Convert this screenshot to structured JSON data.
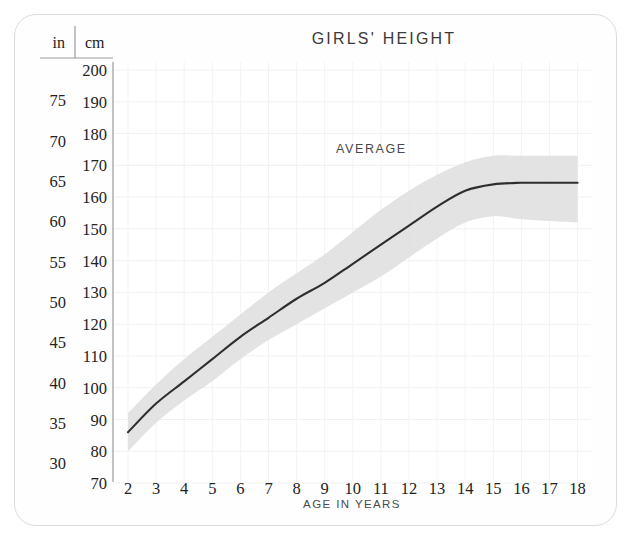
{
  "card": {
    "title": "GIRLS' HEIGHT"
  },
  "axes": {
    "left_header_in": "in",
    "left_header_cm": "cm",
    "x_axis_label": "AGE IN YEARS",
    "cm_ticks": [
      "200",
      "190",
      "180",
      "170",
      "160",
      "150",
      "140",
      "130",
      "120",
      "110",
      "100",
      "90",
      "80",
      "70"
    ],
    "in_ticks": [
      "75",
      "70",
      "65",
      "60",
      "55",
      "50",
      "45",
      "40",
      "35",
      "30"
    ],
    "age_ticks": [
      "2",
      "3",
      "4",
      "5",
      "6",
      "7",
      "8",
      "9",
      "10",
      "11",
      "12",
      "13",
      "14",
      "15",
      "16",
      "17",
      "18"
    ]
  },
  "annotations": {
    "average": "AVERAGE"
  },
  "colors": {
    "curve": "#2e2e2e",
    "band": "#dddddd",
    "grid": "#f0f0f0",
    "border": "#dcdcdc",
    "text": "#232323",
    "background": "#fefefe"
  },
  "chart_data": {
    "type": "line",
    "title": "GIRLS' HEIGHT",
    "xlabel": "AGE IN YEARS",
    "ylabel": "cm",
    "ylabel_secondary": "in",
    "xlim": [
      2,
      18
    ],
    "ylim": [
      70,
      200
    ],
    "grid": true,
    "legend": "none",
    "annotations": [
      {
        "text": "AVERAGE",
        "x": 9.4,
        "y": 176
      }
    ],
    "x": [
      2,
      3,
      4,
      5,
      6,
      7,
      8,
      9,
      10,
      11,
      12,
      13,
      14,
      15,
      16,
      17,
      18
    ],
    "series": [
      {
        "name": "AVERAGE",
        "unit": "cm",
        "values": [
          86,
          95,
          102,
          109,
          116,
          122,
          128,
          133,
          139,
          145,
          151,
          157,
          162,
          164,
          164.5,
          164.5,
          164.5
        ]
      },
      {
        "name": "normal range upper",
        "unit": "cm",
        "values": [
          92,
          101,
          109,
          116,
          123,
          130,
          136,
          142,
          149,
          156,
          162,
          167,
          171,
          173,
          173,
          173,
          173
        ]
      },
      {
        "name": "normal range lower",
        "unit": "cm",
        "values": [
          80,
          89,
          96,
          102,
          109,
          115,
          120,
          125,
          130,
          135,
          141,
          147,
          152,
          154,
          153,
          152.5,
          152
        ]
      }
    ],
    "cm_tick_values": [
      200,
      190,
      180,
      170,
      160,
      150,
      140,
      130,
      120,
      110,
      100,
      90,
      80,
      70
    ],
    "in_tick_values": [
      75,
      70,
      65,
      60,
      55,
      50,
      45,
      40,
      35,
      30
    ],
    "in_tick_cm_equivalents": [
      190.5,
      177.8,
      165.1,
      152.4,
      139.7,
      127.0,
      114.3,
      101.6,
      88.9,
      76.2
    ]
  }
}
